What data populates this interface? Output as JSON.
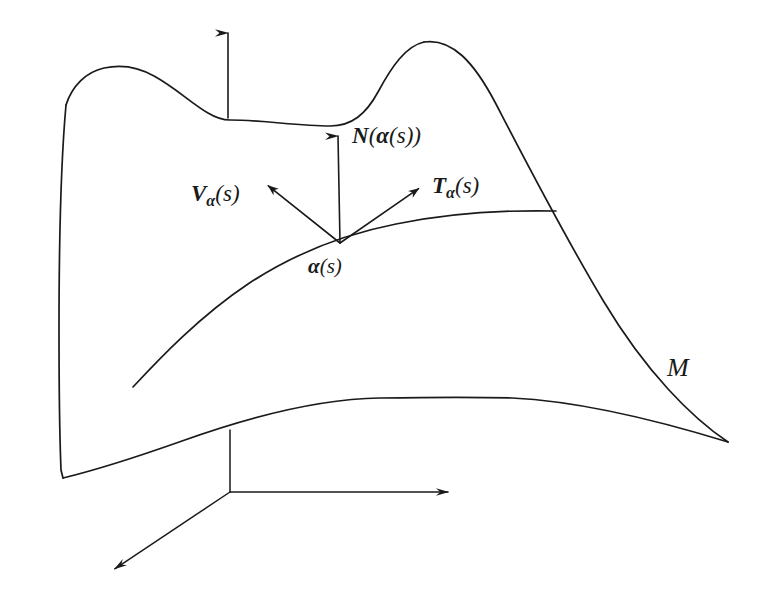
{
  "figure": {
    "stroke_color": "#1a1a1a",
    "background_color": "#ffffff",
    "width": 772,
    "height": 609
  },
  "labels": {
    "normal_vector": {
      "head": "N",
      "open": "(",
      "arg_head": "α",
      "arg_open": "(",
      "arg_param": "s",
      "arg_close": ")",
      "close": ")",
      "full_text": "N(α(s))"
    },
    "v_vector": {
      "head": "V",
      "subscript": "α",
      "open": "(",
      "param": "s",
      "close": ")",
      "full_text": "Vα(s)"
    },
    "t_vector": {
      "head": "T",
      "subscript": "α",
      "open": "(",
      "param": "s",
      "close": ")",
      "full_text": "Tα(s)"
    },
    "curve_point": {
      "head": "α",
      "open": "(",
      "param": "s",
      "close": ")",
      "full_text": "α(s)"
    },
    "surface": {
      "name": "M",
      "full_text": "M"
    }
  },
  "geometry": {
    "surface_outline": "M 66,105 C 72,86 86,72 104,68 C 122,64 140,68 154,76 C 176,88 192,104 208,113 C 218,119 224,120 230,120 C 262,120 298,126 330,126 C 352,126 366,114 378,92 C 392,66 406,46 424,42 C 450,37 470,56 492,96 C 520,148 560,228 604,300 C 648,372 692,418 728,442 C 700,436 660,426 600,418 C 540,410 470,402 400,399 C 330,396 250,418 180,444 C 130,462 92,472 63,478 C 62,420 62,330 63,240 C 64,175 65,135 66,105 Z",
    "top_edge": "M 66,105 C 72,86 86,72 104,68 C 122,64 140,68 154,76 C 176,88 192,104 208,113 C 218,119 224,120 230,120 C 262,120 298,126 330,126 C 352,126 366,114 378,92 C 392,66 406,46 424,42",
    "right_edge": "M 424,42 C 452,38 474,62 496,104 C 524,158 562,232 604,302 C 646,372 692,418 728,442",
    "bottom_edge": "M 63,478 C 96,470 134,458 182,441 C 246,418 316,399 380,398 C 440,397 480,397 512,398 C 576,401 650,418 728,442",
    "left_edge": "M 66,105 C 61,160 59,250 59,330 C 59,400 60,445 61,470 L 63,478",
    "curve_alpha": "M 133,387 C 160,358 200,316 248,284 C 292,255 340,235 396,224 C 450,213 510,210 556,211",
    "normal_arrow": {
      "x1": 340,
      "y1": 243,
      "x2": 338,
      "y2": 136
    },
    "v_arrow": {
      "x1": 340,
      "y1": 243,
      "x2": 266,
      "y2": 184
    },
    "t_arrow": {
      "x1": 340,
      "y1": 243,
      "x2": 421,
      "y2": 187
    },
    "top_arrow": {
      "x1": 228,
      "y1": 118,
      "x2": 228,
      "y2": 33
    },
    "axis_vertical": {
      "x1": 230,
      "y1": 430,
      "x2": 230,
      "y2": 492
    },
    "axis_x": {
      "x1": 230,
      "y1": 492,
      "x2": 457,
      "y2": 492
    },
    "axis_y": {
      "x1": 230,
      "y1": 492,
      "x2": 104,
      "y2": 576
    }
  }
}
